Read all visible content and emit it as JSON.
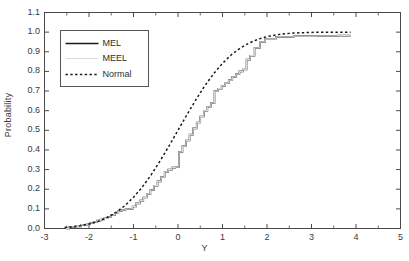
{
  "chart_data": {
    "type": "line",
    "title": "",
    "xlabel": "Y",
    "ylabel": "Probability",
    "xlim": [
      -3,
      5
    ],
    "ylim": [
      0.0,
      1.1
    ],
    "grid": false,
    "legend_position": "upper left",
    "xticks": [
      "-3",
      "-2",
      "-1",
      "0",
      "1",
      "2",
      "3",
      "4",
      "5"
    ],
    "xtick_values": [
      -3,
      -2,
      -1,
      0,
      1,
      2,
      3,
      4,
      5
    ],
    "yticks": [
      "0.0",
      "0.1",
      "0.2",
      "0.3",
      "0.4",
      "0.5",
      "0.6",
      "0.7",
      "0.8",
      "0.9",
      "1.0",
      "1.1"
    ],
    "ytick_values": [
      0.0,
      0.1,
      0.2,
      0.3,
      0.4,
      0.5,
      0.6,
      0.7,
      0.8,
      0.9,
      1.0,
      1.1
    ],
    "series": [
      {
        "name": "MEL",
        "style": "solid",
        "color": "#1a1a1a",
        "width": 1.6,
        "step": true,
        "x": [
          -2.52,
          -2.45,
          -2.3,
          -2.18,
          -2.05,
          -1.98,
          -1.9,
          -1.82,
          -1.74,
          -1.66,
          -1.58,
          -1.5,
          -1.42,
          -1.34,
          -1.26,
          -1.18,
          -1.1,
          -1.02,
          -0.94,
          -0.86,
          -0.78,
          -0.7,
          -0.62,
          -0.54,
          -0.46,
          -0.38,
          -0.3,
          -0.22,
          -0.14,
          -0.06,
          0.02,
          0.1,
          0.18,
          0.26,
          0.34,
          0.42,
          0.5,
          0.58,
          0.66,
          0.74,
          0.82,
          0.9,
          0.98,
          1.06,
          1.14,
          1.22,
          1.3,
          1.38,
          1.46,
          1.54,
          1.62,
          1.72,
          1.84,
          1.96,
          2.2,
          2.6,
          3.1,
          3.6,
          3.88
        ],
        "y": [
          0.0,
          0.008,
          0.01,
          0.018,
          0.022,
          0.028,
          0.032,
          0.04,
          0.046,
          0.052,
          0.058,
          0.068,
          0.08,
          0.09,
          0.095,
          0.098,
          0.1,
          0.112,
          0.128,
          0.142,
          0.158,
          0.176,
          0.196,
          0.218,
          0.24,
          0.262,
          0.288,
          0.3,
          0.31,
          0.312,
          0.39,
          0.42,
          0.448,
          0.478,
          0.51,
          0.54,
          0.57,
          0.6,
          0.62,
          0.64,
          0.7,
          0.712,
          0.726,
          0.74,
          0.756,
          0.772,
          0.786,
          0.8,
          0.81,
          0.86,
          0.88,
          0.92,
          0.95,
          0.966,
          0.976,
          0.98,
          0.981,
          0.982,
          0.982
        ]
      },
      {
        "name": "MEEL",
        "style": "solid",
        "color": "#d8d8d8",
        "width": 1.2,
        "step": true,
        "x": [
          -2.52,
          -2.45,
          -2.3,
          -2.18,
          -2.05,
          -1.98,
          -1.9,
          -1.82,
          -1.74,
          -1.66,
          -1.58,
          -1.5,
          -1.42,
          -1.34,
          -1.26,
          -1.18,
          -1.1,
          -1.02,
          -0.94,
          -0.86,
          -0.78,
          -0.7,
          -0.62,
          -0.54,
          -0.46,
          -0.38,
          -0.3,
          -0.22,
          -0.14,
          -0.06,
          0.02,
          0.1,
          0.18,
          0.26,
          0.34,
          0.42,
          0.5,
          0.58,
          0.66,
          0.74,
          0.82,
          0.9,
          0.98,
          1.06,
          1.14,
          1.22,
          1.3,
          1.38,
          1.46,
          1.54,
          1.62,
          1.72,
          1.84,
          1.96,
          2.2,
          2.6,
          3.1,
          3.6,
          3.88
        ],
        "y": [
          0.0,
          0.008,
          0.01,
          0.018,
          0.022,
          0.028,
          0.032,
          0.04,
          0.046,
          0.052,
          0.058,
          0.068,
          0.08,
          0.09,
          0.095,
          0.098,
          0.1,
          0.112,
          0.128,
          0.142,
          0.158,
          0.176,
          0.196,
          0.218,
          0.24,
          0.262,
          0.288,
          0.3,
          0.31,
          0.312,
          0.39,
          0.42,
          0.448,
          0.478,
          0.51,
          0.54,
          0.57,
          0.6,
          0.62,
          0.64,
          0.7,
          0.712,
          0.726,
          0.74,
          0.756,
          0.772,
          0.786,
          0.8,
          0.81,
          0.86,
          0.88,
          0.92,
          0.95,
          0.966,
          0.976,
          0.98,
          0.981,
          0.982,
          0.982
        ]
      },
      {
        "name": "Normal",
        "style": "dotted",
        "color": "#1a1a1a",
        "width": 1.5,
        "step": false,
        "x": [
          -2.55,
          -2.4,
          -2.2,
          -2.0,
          -1.8,
          -1.6,
          -1.4,
          -1.2,
          -1.0,
          -0.8,
          -0.6,
          -0.4,
          -0.2,
          0.0,
          0.2,
          0.4,
          0.6,
          0.8,
          1.0,
          1.2,
          1.4,
          1.6,
          1.8,
          2.0,
          2.2,
          2.4,
          2.6,
          2.8,
          3.0,
          3.2,
          3.4,
          3.6,
          3.88
        ],
        "y": [
          0.005,
          0.008,
          0.014,
          0.023,
          0.036,
          0.055,
          0.081,
          0.115,
          0.159,
          0.212,
          0.274,
          0.345,
          0.421,
          0.5,
          0.579,
          0.655,
          0.726,
          0.788,
          0.841,
          0.885,
          0.919,
          0.945,
          0.964,
          0.977,
          0.986,
          0.992,
          0.995,
          0.997,
          0.9987,
          0.9993,
          0.9997,
          0.9998,
          0.9999
        ]
      }
    ]
  },
  "legend": {
    "entries": [
      {
        "label": "MEL"
      },
      {
        "label": "MEEL"
      },
      {
        "label": "Normal"
      }
    ]
  }
}
